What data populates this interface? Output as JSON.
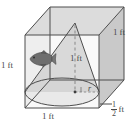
{
  "figure": {
    "shapes": {
      "container": "cube",
      "inscribed": "cone",
      "contents_icon": "fish-icon"
    },
    "colors": {
      "outline": "#4d4d4d",
      "cube_top_face": "#d9d9d9",
      "cube_right_face": "#c9c9c9",
      "cube_front_face": "#f2f2f2",
      "cube_left_face": "#e3e3e3",
      "cone_fill": "#cfcfcf",
      "cone_base_fill": "#e6e6e6",
      "fish_body": "#6e6e6e",
      "label_text": "#4a4a4a",
      "dashed_guide": "#9a9a9a"
    },
    "labels": {
      "left_height": "1 ft",
      "cone_height": "1 ft",
      "right_depth": "1 ft",
      "bottom_width": "1 ft",
      "radius": "r",
      "half_foot_numerator": "1",
      "half_foot_denominator": "2",
      "half_foot_unit": "ft"
    }
  }
}
